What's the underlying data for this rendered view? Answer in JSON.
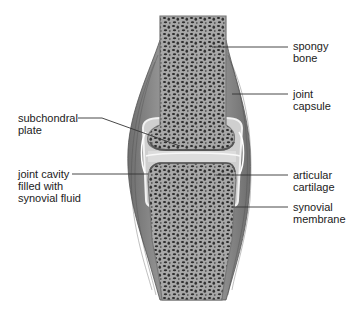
{
  "diagram": {
    "type": "anatomical-illustration",
    "colors": {
      "background": "#ffffff",
      "bone_fill": "#9a9a9a",
      "trabecula_dark": "#2a2a2a",
      "cartilage": "#c9c9c9",
      "capsule": "#7d7d7d",
      "leader_line": "#333333",
      "text": "#222222"
    },
    "labels": [
      {
        "id": "spongy-bone",
        "text": "spongy\nbone",
        "side": "right"
      },
      {
        "id": "joint-capsule",
        "text": "joint\ncapsule",
        "side": "right"
      },
      {
        "id": "subchondral-plate",
        "text": "subchondral\nplate",
        "side": "left"
      },
      {
        "id": "joint-cavity",
        "text": "joint cavity\nfilled with\nsynovial fluid",
        "side": "left"
      },
      {
        "id": "articular-cartilage",
        "text": "articular\ncartilage",
        "side": "right"
      },
      {
        "id": "synovial-membrane",
        "text": "synovial\nmembrane",
        "side": "right"
      }
    ]
  }
}
